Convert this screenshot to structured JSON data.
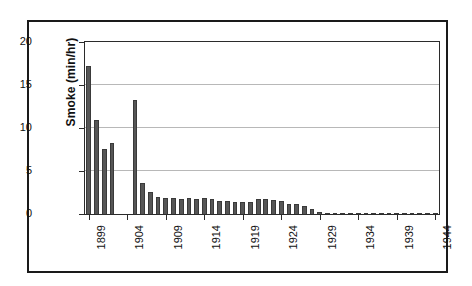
{
  "chart_data": {
    "type": "bar",
    "title": "",
    "subtitle": "",
    "xlabel": "",
    "ylabel": "Smoke (min/hr)",
    "ylim": [
      0,
      20
    ],
    "yticks": [
      0,
      5,
      10,
      15,
      20
    ],
    "xlim": [
      1899,
      1944
    ],
    "xticks": [
      1899,
      1904,
      1909,
      1914,
      1919,
      1924,
      1929,
      1934,
      1939,
      1944
    ],
    "grid": "horizontal",
    "legend": "none",
    "bar_color": "#565656",
    "bar_edge_color": "#3a3a3a",
    "plot_background": "#ffffff",
    "gridline_color": "#b8b8b8",
    "axis_color": "#2b2b2b",
    "frame_color": "#1a1a1a",
    "categories": [
      1899,
      1900,
      1901,
      1902,
      1903,
      1904,
      1905,
      1906,
      1907,
      1908,
      1909,
      1910,
      1911,
      1912,
      1913,
      1914,
      1915,
      1916,
      1917,
      1918,
      1919,
      1920,
      1921,
      1922,
      1923,
      1924,
      1925,
      1926,
      1927,
      1928,
      1929,
      1930,
      1931,
      1932,
      1933,
      1934,
      1935,
      1936,
      1937,
      1938,
      1939,
      1940,
      1941,
      1942,
      1943,
      1944
    ],
    "values": [
      17.2,
      10.9,
      7.6,
      8.3,
      null,
      null,
      13.2,
      3.6,
      2.6,
      2.0,
      1.9,
      1.9,
      1.7,
      1.9,
      1.8,
      1.9,
      1.8,
      1.5,
      1.5,
      1.4,
      1.4,
      1.4,
      1.7,
      1.8,
      1.6,
      1.5,
      1.2,
      1.2,
      0.9,
      0.6,
      0.2,
      0.15,
      0.12,
      0.12,
      0.12,
      0.12,
      0.12,
      0.12,
      0.12,
      0.12,
      0.12,
      0.12,
      0.12,
      0.12,
      0.12,
      0.12
    ],
    "missing_years": [
      1903,
      1904,
      1905
    ],
    "units": "min/hr"
  },
  "figure": {
    "ylabel": "Smoke (min/hr)"
  }
}
